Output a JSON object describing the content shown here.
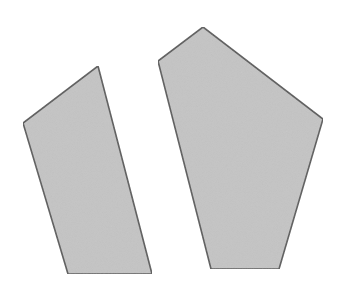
{
  "canvas": {
    "width": 343,
    "height": 286,
    "background": "#ffffff"
  },
  "style": {
    "fill": "#c4c4c4",
    "stroke": "#5a5a5a"
  },
  "shapes": [
    {
      "name": "quadrilateral",
      "vertices": 4,
      "points": "98,66 23,123 68,274 152,274"
    },
    {
      "name": "pentagon",
      "vertices": 5,
      "points": "203,27 158,61 211,269 279,269 323,119"
    }
  ]
}
